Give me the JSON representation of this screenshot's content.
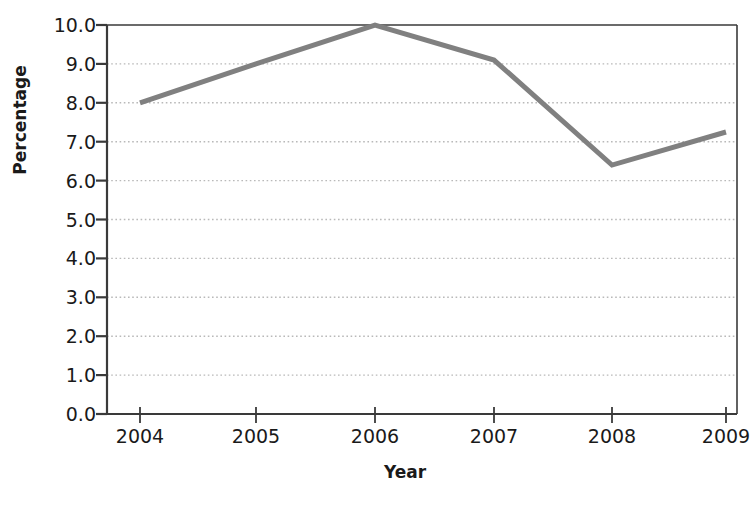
{
  "chart_data": {
    "type": "line",
    "title": "",
    "xlabel": "Year",
    "ylabel": "Percentage",
    "categories": [
      "2004",
      "2005",
      "2006",
      "2007",
      "2008",
      "2009"
    ],
    "x": [
      2004,
      2005,
      2006,
      2007,
      2008,
      2009
    ],
    "values": [
      8.0,
      9.0,
      10.0,
      9.1,
      6.4,
      7.25
    ],
    "series": [
      {
        "name": "Percentage",
        "values": [
          8.0,
          9.0,
          10.0,
          9.1,
          6.4,
          7.25
        ],
        "color": "#808080"
      }
    ],
    "ylim": [
      0.0,
      10.0
    ],
    "ytick_step": 1.0,
    "ytick_labels": [
      "0.0",
      "1.0",
      "2.0",
      "3.0",
      "4.0",
      "5.0",
      "6.0",
      "7.0",
      "8.0",
      "9.0",
      "10.0"
    ],
    "xtick_labels": [
      "2004",
      "2005",
      "2006",
      "2007",
      "2008",
      "2009"
    ],
    "grid": {
      "horizontal": true,
      "vertical": false,
      "style": "dotted",
      "color": "#b9b9b9"
    },
    "legend": null,
    "legend_position": "none",
    "line_color": "#808080",
    "line_width": 5,
    "axis_color": "#3a3a3a",
    "background_color": "#ffffff",
    "annotations": []
  },
  "figure": {
    "name": "line-chart-percentage-by-year"
  }
}
